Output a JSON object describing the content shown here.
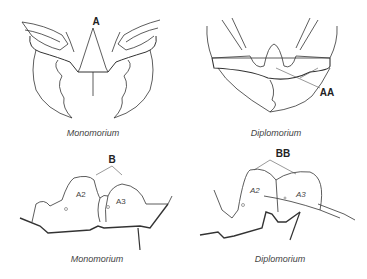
{
  "panels": {
    "top_left": {
      "caption": "Monomorium",
      "label": "A"
    },
    "top_right": {
      "caption": "Diplomorium",
      "label": "AA"
    },
    "bottom_left": {
      "caption": "Monomorium",
      "label": "B",
      "segments": [
        "A2",
        "A3"
      ]
    },
    "bottom_right": {
      "caption": "Diplomorium",
      "label": "BB",
      "segments": [
        "A2",
        "A3"
      ]
    }
  },
  "colors": {
    "line": "#222222",
    "thin": "#555555",
    "text": "#444444",
    "background": "#ffffff"
  }
}
